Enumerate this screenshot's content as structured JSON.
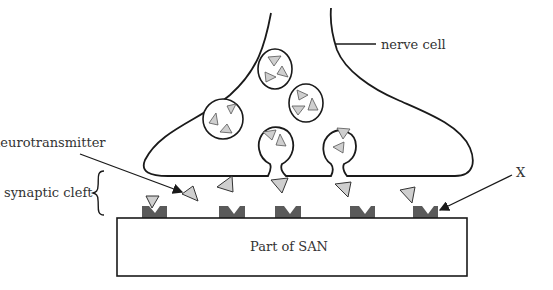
{
  "labels": {
    "nerve_cell": "nerve cell",
    "neurotransmitter": "neurotransmitter",
    "synaptic_cleft": "synaptic cleft",
    "x": "X",
    "san": "Part of SAN"
  },
  "colors": {
    "outline": "#1a1a1a",
    "vesicle_fill": "#ffffff",
    "neurotransmitter_fill": "#cfcfcf",
    "receptor_fill": "#5a5a5a",
    "text": "#333333"
  }
}
